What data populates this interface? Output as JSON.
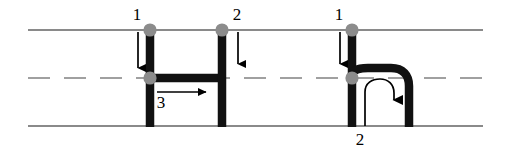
{
  "diagram": {
    "colors": {
      "road_line": "#8a8a8a",
      "center_dash": "#a0a0a0",
      "path": "#111111",
      "node": "#8c8c8c",
      "arrow": "#000000",
      "background": "#ffffff",
      "label_text": "#000000"
    },
    "road": {
      "top_edge_y": 30,
      "bottom_edge_y": 126,
      "center_dash_y": 78,
      "x_start": 28,
      "x_end": 483,
      "dash_pattern": "22 14"
    },
    "maneuvers": [
      {
        "id": "left-jog",
        "name": "lane-change-jog",
        "segments": [
          {
            "type": "vertical",
            "x": 150,
            "y1": 30,
            "y2": 126
          },
          {
            "type": "horizontal",
            "y": 78,
            "x1": 150,
            "x2": 222
          },
          {
            "type": "vertical",
            "x": 222,
            "y1": 30,
            "y2": 126
          }
        ],
        "nodes": [
          {
            "cx": 150,
            "cy": 30
          },
          {
            "cx": 150,
            "cy": 78
          },
          {
            "cx": 222,
            "cy": 30
          }
        ]
      },
      {
        "id": "right-uturn",
        "name": "u-turn",
        "segments": [
          {
            "type": "vertical",
            "x": 352,
            "y1": 30,
            "y2": 126
          },
          {
            "type": "arch",
            "x_left": 352,
            "x_right": 409,
            "y_top": 78,
            "y_bottom": 126
          }
        ],
        "nodes": [
          {
            "cx": 352,
            "cy": 30
          },
          {
            "cx": 352,
            "cy": 78
          }
        ]
      }
    ],
    "arrows": [
      {
        "id": "arrow-1-left",
        "label": "1",
        "direction": "down",
        "label_x": 137,
        "label_y": 15,
        "x": 138,
        "y1": 32,
        "y2": 76
      },
      {
        "id": "arrow-2-left",
        "label": "2",
        "direction": "down",
        "label_x": 237,
        "label_y": 15,
        "x": 238,
        "y1": 32,
        "y2": 72
      },
      {
        "id": "arrow-3-left",
        "label": "3",
        "direction": "right",
        "label_x": 161,
        "label_y": 103,
        "y": 92,
        "x1": 157,
        "x2": 214
      },
      {
        "id": "arrow-1-right",
        "label": "1",
        "direction": "down",
        "label_x": 339,
        "label_y": 15,
        "x": 340,
        "y1": 32,
        "y2": 72
      },
      {
        "id": "arrow-2-right",
        "label": "2",
        "direction": "u-turn-curve",
        "label_x": 358,
        "label_y": 140
      }
    ],
    "labels": {
      "left_top_1": "1",
      "left_top_2": "2",
      "left_mid_3": "3",
      "right_top_1": "1",
      "right_bottom_2": "2"
    }
  }
}
